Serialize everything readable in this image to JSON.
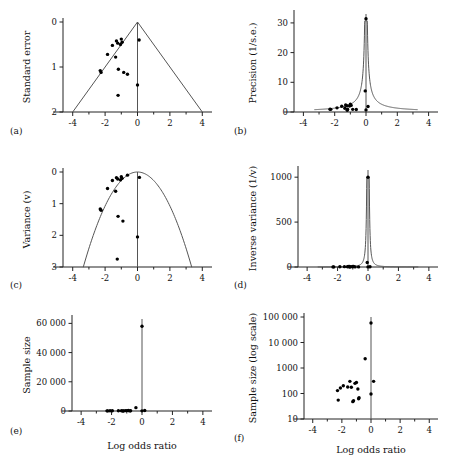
{
  "figure": {
    "shared_xlabel": "Log odds ratio",
    "x_ticks": [
      "-4",
      "-2",
      "0",
      "2",
      "4"
    ],
    "x_tick_values": [
      -4,
      -2,
      0,
      2,
      4
    ],
    "xlim": [
      -4.6,
      4.6
    ]
  },
  "chart_data": [
    {
      "type": "scatter",
      "tag": "(a)",
      "title": "",
      "xlabel": "Log odds ratio",
      "ylabel": "Standard error",
      "xlim": [
        -4.6,
        4.6
      ],
      "ylim": [
        2,
        0
      ],
      "y_inverted": true,
      "x_ticks": [
        -4,
        -2,
        0,
        2,
        4
      ],
      "y_ticks": [
        0,
        1,
        2
      ],
      "y_tick_labels": [
        "0",
        "1",
        "2"
      ],
      "grid": false,
      "legend": "none",
      "reference_line_x": 0,
      "overlay": "funnel-triangle",
      "overlay_apex": [
        0,
        0
      ],
      "overlay_left_base": [
        -4,
        2
      ],
      "overlay_right_base": [
        4,
        2
      ],
      "points": [
        [
          -2.3,
          1.08
        ],
        [
          -2.25,
          1.12
        ],
        [
          -1.85,
          0.72
        ],
        [
          -1.55,
          0.52
        ],
        [
          -1.35,
          0.78
        ],
        [
          -1.3,
          0.42
        ],
        [
          -1.22,
          0.47
        ],
        [
          -1.2,
          1.63
        ],
        [
          -1.18,
          1.05
        ],
        [
          -1.05,
          0.5
        ],
        [
          -1.0,
          0.38
        ],
        [
          -0.95,
          0.45
        ],
        [
          -0.85,
          1.12
        ],
        [
          -0.62,
          1.16
        ],
        [
          0.0,
          1.4
        ],
        [
          0.1,
          0.4
        ]
      ]
    },
    {
      "type": "scatter",
      "tag": "(b)",
      "title": "",
      "xlabel": "Log odds ratio",
      "ylabel": "Precision (1/s.e.)",
      "xlim": [
        -4.6,
        4.6
      ],
      "ylim": [
        0,
        33
      ],
      "y_inverted": false,
      "x_ticks": [
        -4,
        -2,
        0,
        2,
        4
      ],
      "y_ticks": [
        0,
        10,
        20,
        30
      ],
      "y_tick_labels": [
        "0",
        "10",
        "20",
        "30"
      ],
      "grid": false,
      "legend": "none",
      "reference_line_x": 0,
      "overlay": "precision-funnel",
      "points": [
        [
          -2.3,
          0.93
        ],
        [
          -2.25,
          0.89
        ],
        [
          -1.85,
          1.39
        ],
        [
          -1.55,
          1.92
        ],
        [
          -1.35,
          1.28
        ],
        [
          -1.3,
          2.38
        ],
        [
          -1.22,
          2.13
        ],
        [
          -1.2,
          0.61
        ],
        [
          -1.18,
          0.95
        ],
        [
          -1.05,
          2.0
        ],
        [
          -1.0,
          2.63
        ],
        [
          -0.95,
          2.22
        ],
        [
          -0.85,
          0.89
        ],
        [
          -0.62,
          0.86
        ],
        [
          -0.05,
          7.1
        ],
        [
          0.0,
          31.4
        ],
        [
          0.0,
          0.71
        ],
        [
          0.13,
          1.85
        ]
      ]
    },
    {
      "type": "scatter",
      "tag": "(c)",
      "title": "",
      "xlabel": "Log odds ratio",
      "ylabel": "Variance (v)",
      "xlim": [
        -4.6,
        4.6
      ],
      "ylim": [
        3,
        0
      ],
      "y_inverted": true,
      "x_ticks": [
        -4,
        -2,
        0,
        2,
        4
      ],
      "y_ticks": [
        0,
        1,
        2,
        3
      ],
      "y_tick_labels": [
        "0",
        "1",
        "2",
        "3"
      ],
      "grid": false,
      "legend": "none",
      "reference_line_x": 0,
      "overlay": "parabola",
      "points": [
        [
          -2.3,
          1.17
        ],
        [
          -2.25,
          1.21
        ],
        [
          -1.85,
          0.52
        ],
        [
          -1.55,
          0.27
        ],
        [
          -1.35,
          0.61
        ],
        [
          -1.3,
          0.18
        ],
        [
          -1.25,
          2.75
        ],
        [
          -1.22,
          0.22
        ],
        [
          -1.2,
          1.4
        ],
        [
          -1.05,
          0.25
        ],
        [
          -1.0,
          0.15
        ],
        [
          -0.95,
          0.2
        ],
        [
          -0.9,
          1.55
        ],
        [
          -0.62,
          0.1
        ],
        [
          0.0,
          2.05
        ],
        [
          0.12,
          0.17
        ]
      ]
    },
    {
      "type": "scatter",
      "tag": "(d)",
      "title": "",
      "xlabel": "Log odds ratio",
      "ylabel": "Inverse variance (1/v)",
      "xlim": [
        -4.6,
        4.6
      ],
      "ylim": [
        0,
        1080
      ],
      "y_inverted": false,
      "x_ticks": [
        -4,
        -2,
        0,
        2,
        4
      ],
      "y_ticks": [
        0,
        500,
        1000
      ],
      "y_tick_labels": [
        "0",
        "500",
        "1000"
      ],
      "grid": false,
      "legend": "none",
      "reference_line_x": 0,
      "overlay": "inverse-variance-funnel",
      "points": [
        [
          -2.3,
          1
        ],
        [
          -2.25,
          1
        ],
        [
          -1.85,
          2
        ],
        [
          -1.55,
          4
        ],
        [
          -1.35,
          2
        ],
        [
          -1.3,
          6
        ],
        [
          -1.22,
          5
        ],
        [
          -1.2,
          1
        ],
        [
          -1.18,
          1
        ],
        [
          -1.05,
          4
        ],
        [
          -1.0,
          7
        ],
        [
          -0.95,
          5
        ],
        [
          -0.85,
          1
        ],
        [
          -0.62,
          1
        ],
        [
          -0.05,
          50
        ],
        [
          0.0,
          1000
        ],
        [
          0.0,
          1
        ],
        [
          0.13,
          3
        ]
      ]
    },
    {
      "type": "scatter",
      "tag": "(e)",
      "title": "",
      "xlabel": "Log odds ratio",
      "ylabel": "Sample size",
      "xlim": [
        -4.6,
        4.6
      ],
      "ylim": [
        0,
        63000
      ],
      "y_inverted": false,
      "x_ticks": [
        -4,
        -2,
        0,
        2,
        4
      ],
      "y_ticks": [
        0,
        20000,
        40000,
        60000
      ],
      "y_tick_labels": [
        "0",
        "20 000",
        "40 000",
        "60 000"
      ],
      "grid": false,
      "legend": "none",
      "reference_line_x": 0,
      "overlay": "none",
      "points": [
        [
          -2.3,
          100
        ],
        [
          -2.25,
          60
        ],
        [
          -2.1,
          140
        ],
        [
          -1.95,
          180
        ],
        [
          -1.55,
          200
        ],
        [
          -1.35,
          190
        ],
        [
          -1.25,
          50
        ],
        [
          -1.22,
          55
        ],
        [
          -1.1,
          230
        ],
        [
          -1.0,
          280
        ],
        [
          -0.9,
          300
        ],
        [
          -0.8,
          70
        ],
        [
          -0.75,
          160
        ],
        [
          -0.4,
          2300
        ],
        [
          0.0,
          58000
        ],
        [
          0.0,
          95
        ],
        [
          0.18,
          300
        ]
      ]
    },
    {
      "type": "scatter",
      "tag": "(f)",
      "title": "",
      "xlabel": "Log odds ratio",
      "ylabel": "Sample size (log scale)",
      "xlim": [
        -4.6,
        4.6
      ],
      "ylim": [
        10,
        100000
      ],
      "y_scale": "log",
      "y_inverted": false,
      "x_ticks": [
        -4,
        -2,
        0,
        2,
        4
      ],
      "y_ticks": [
        10,
        100,
        1000,
        10000,
        100000
      ],
      "y_tick_labels": [
        "10",
        "100",
        "1000",
        "10 000",
        "100 000"
      ],
      "grid": false,
      "legend": "none",
      "reference_line_x": 0,
      "overlay": "none",
      "points": [
        [
          -2.3,
          130
        ],
        [
          -2.25,
          55
        ],
        [
          -2.1,
          165
        ],
        [
          -1.9,
          200
        ],
        [
          -1.6,
          180
        ],
        [
          -1.45,
          300
        ],
        [
          -1.35,
          175
        ],
        [
          -1.25,
          48
        ],
        [
          -1.2,
          52
        ],
        [
          -1.1,
          250
        ],
        [
          -1.0,
          270
        ],
        [
          -0.9,
          150
        ],
        [
          -0.85,
          62
        ],
        [
          -0.82,
          68
        ],
        [
          -0.4,
          2300
        ],
        [
          0.0,
          58000
        ],
        [
          0.0,
          95
        ],
        [
          0.18,
          300
        ]
      ]
    }
  ]
}
